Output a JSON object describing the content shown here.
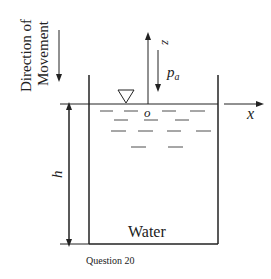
{
  "diagram": {
    "direction_label_line1": "Direction of",
    "direction_label_line2": "Movement",
    "z_axis_label": "z",
    "pressure_label": "p",
    "pressure_subscript": "a",
    "origin_label": "o",
    "x_axis_label": "x",
    "height_label": "h",
    "fluid_label": "Water",
    "caption": "Question 20"
  },
  "colors": {
    "line": "#222222",
    "background": "#ffffff"
  }
}
